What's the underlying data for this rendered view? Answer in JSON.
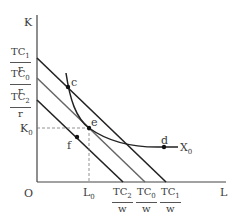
{
  "diagram": {
    "axes": {
      "y_label": "K",
      "x_label": "L",
      "origin_label": "O"
    },
    "y_intercepts": [
      {
        "num": "TC",
        "sub": "1",
        "den": "r"
      },
      {
        "num": "TC",
        "sub": "0",
        "den": "r"
      },
      {
        "num": "TC",
        "sub": "2",
        "den": "r"
      }
    ],
    "x_intercepts": [
      {
        "num": "TC",
        "sub": "2",
        "den": "w"
      },
      {
        "num": "TC",
        "sub": "0",
        "den": "w"
      },
      {
        "num": "TC",
        "sub": "1",
        "den": "w"
      }
    ],
    "k0": {
      "main": "K",
      "sub": "0"
    },
    "l0": {
      "main": "L",
      "sub": "0"
    },
    "isoquant": {
      "main": "X",
      "sub": "0"
    },
    "points": {
      "c": "c",
      "d": "d",
      "e": "e",
      "f": "f"
    },
    "colors": {
      "line_dark": "#222222",
      "line_mid": "#555555",
      "dashed": "#777777"
    }
  }
}
